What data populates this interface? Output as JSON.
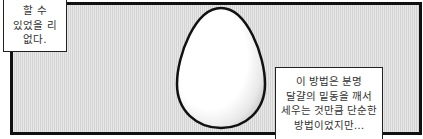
{
  "panel": {
    "background_color": "#dcdcdc",
    "border_color": "#111111",
    "subject": "egg"
  },
  "captions": {
    "left": {
      "lines": [
        "할 수",
        "있었을 리",
        "없다."
      ]
    },
    "right": {
      "lines": [
        "이 방법은 분명",
        "달걀의 밑동을 깨서",
        "세우는 것만큼 단순한",
        "방법이었지만…"
      ]
    }
  }
}
